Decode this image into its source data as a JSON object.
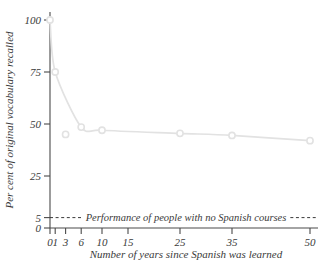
{
  "chart_data": {
    "type": "line",
    "title": "",
    "xlabel": "Number of years since Spanish was learned",
    "ylabel": "Per cent of original vocabulary recalled",
    "x": [
      0,
      1,
      3,
      6,
      10,
      25,
      35,
      50
    ],
    "values": [
      100,
      75,
      45,
      48.5,
      47,
      45.5,
      44.5,
      42
    ],
    "series": [
      {
        "name": "Per cent of original vocabulary recalled",
        "x": [
          0,
          1,
          3,
          6,
          10,
          25,
          35,
          50
        ],
        "values": [
          100,
          75,
          45,
          48.5,
          47,
          45.5,
          44.5,
          42
        ],
        "color": "#e2e2e2",
        "marker": "open-circle"
      }
    ],
    "xlim": [
      0,
      50
    ],
    "ylim": [
      0,
      100
    ],
    "xticks": [
      0,
      1,
      3,
      6,
      10,
      15,
      25,
      35,
      50
    ],
    "xtick_labels": [
      "0",
      "1",
      "3",
      "6",
      "10",
      "15",
      "25",
      "35",
      "50"
    ],
    "yticks": [
      0,
      5,
      25,
      50,
      75,
      100
    ],
    "ytick_labels": [
      "0",
      "5",
      "25",
      "50",
      "75",
      "100"
    ],
    "grid": false,
    "legend": "none",
    "annotations": [
      {
        "name": "no-spanish-courses-reference",
        "text": "Performance of people with no Spanish courses",
        "y": 5,
        "style": "dashed",
        "color": "#3a3a3a"
      }
    ]
  },
  "axes": {
    "x_title": "Number of years since Spanish was learned",
    "y_title": "Per cent of original vocabulary recalled"
  },
  "annotation": {
    "label": "Performance of people with no Spanish courses"
  },
  "colors": {
    "axis": "#4a4a4a",
    "text": "#3a3a3a",
    "data": "#e2e2e2",
    "background": "#ffffff"
  }
}
